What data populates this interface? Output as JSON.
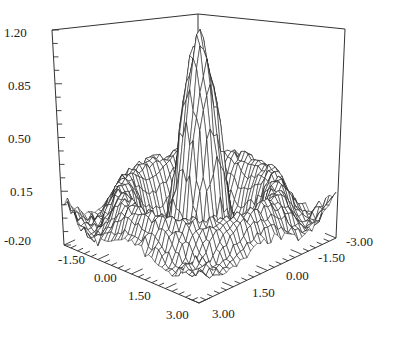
{
  "chart_data": {
    "type": "surface3d",
    "title": "",
    "xlabel": "",
    "ylabel": "",
    "zlabel": "",
    "x_ticks": [
      "-1.50",
      "0.00",
      "1.50",
      "3.00"
    ],
    "y_ticks": [
      "-3.00",
      "-1.50",
      "0.00",
      "1.50",
      "3.00"
    ],
    "z_ticks": [
      "1.20",
      "0.85",
      "0.50",
      "0.15",
      "-0.20"
    ],
    "xlim": [
      -3.0,
      3.0
    ],
    "ylim": [
      -3.0,
      3.0
    ],
    "zlim": [
      -0.2,
      1.2
    ],
    "surface": {
      "description": "Radially symmetric sinc-like (sin(r)/r) surface with noise: sharp central peak reaching ~1.2, surrounding ring near ~0.15-0.2, trough near -0.1, rendered as wireframe mesh",
      "peak_value": 1.2,
      "ring_value": 0.18,
      "grid_resolution": 40,
      "noise": 0.04
    },
    "grid": false,
    "legend": null,
    "style": {
      "line_color": "#1a1a1a",
      "frame_color": "#333333",
      "background": "#ffffff"
    }
  },
  "labels": {
    "z": [
      {
        "text": "1.20",
        "x": 4,
        "y": 37
      },
      {
        "text": "0.85",
        "x": 8,
        "y": 90
      },
      {
        "text": "0.50",
        "x": 8,
        "y": 143
      },
      {
        "text": "0.15",
        "x": 10,
        "y": 196
      },
      {
        "text": "-0.20",
        "x": 4,
        "y": 245
      }
    ],
    "x": [
      {
        "text": "-1.50",
        "x": 58,
        "y": 264
      },
      {
        "text": "0.00",
        "x": 94,
        "y": 282
      },
      {
        "text": "1.50",
        "x": 128,
        "y": 300
      },
      {
        "text": "3.00",
        "x": 166,
        "y": 319
      }
    ],
    "y": [
      {
        "text": "-3.00",
        "x": 346,
        "y": 246
      },
      {
        "text": "-1.50",
        "x": 318,
        "y": 262
      },
      {
        "text": "0.00",
        "x": 286,
        "y": 280
      },
      {
        "text": "1.50",
        "x": 252,
        "y": 297
      },
      {
        "text": "3.00",
        "x": 212,
        "y": 318
      }
    ]
  }
}
